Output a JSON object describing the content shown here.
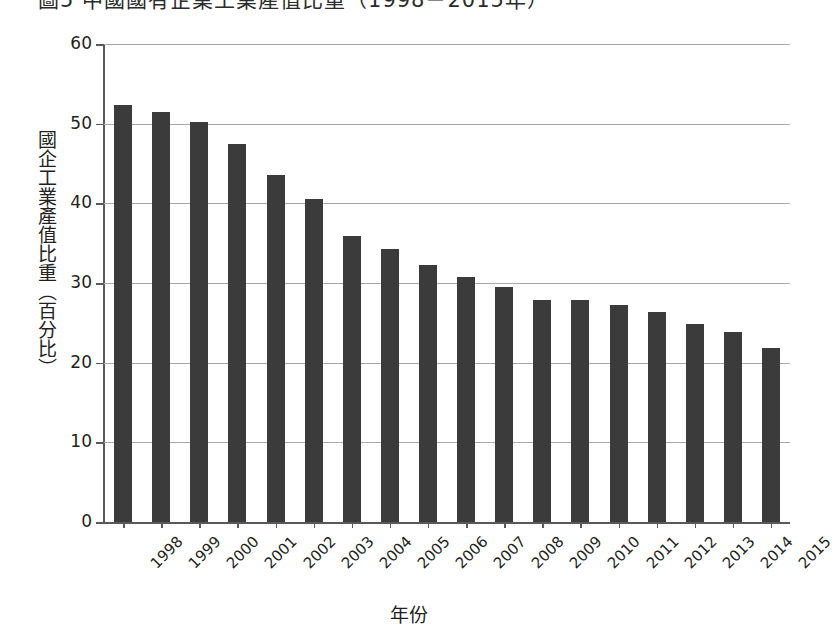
{
  "figure": {
    "title_clipped": "圖5  中國國有企業工業產值比重（1998－2015年）",
    "x_axis_title": "年份",
    "y_axis_title": "國企工業產值比重（百分比）",
    "bar_color": "#3b3b3b",
    "grid_color": "#a7a9ac",
    "axis_color": "#58595b"
  },
  "chart_data": {
    "type": "bar",
    "title": "圖5  中國國有企業工業產值比重（1998－2015年）",
    "xlabel": "年份",
    "ylabel": "國企工業產值比重（百分比）",
    "categories": [
      "1998",
      "1999",
      "2000",
      "2001",
      "2002",
      "2003",
      "2004",
      "2005",
      "2006",
      "2007",
      "2008",
      "2009",
      "2010",
      "2011",
      "2012",
      "2013",
      "2014",
      "2015"
    ],
    "values": [
      52.3,
      51.5,
      50.2,
      47.4,
      43.6,
      40.5,
      35.9,
      34.3,
      32.2,
      30.7,
      29.5,
      27.9,
      27.9,
      27.2,
      26.4,
      24.9,
      23.8,
      21.8
    ],
    "ylim": [
      0,
      60
    ],
    "yticks": [
      0,
      10,
      20,
      30,
      40,
      50,
      60
    ],
    "ytick_labels": [
      "0",
      "10",
      "20",
      "30",
      "40",
      "50",
      "60"
    ],
    "grid": "horizontal",
    "legend": "none"
  }
}
